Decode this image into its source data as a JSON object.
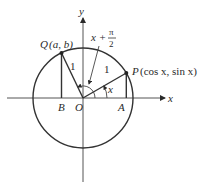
{
  "diagram": {
    "type": "unit-circle",
    "axes": {
      "x_label": "x",
      "y_label": "y"
    },
    "points": {
      "origin": {
        "label": "O"
      },
      "P": {
        "label": "P",
        "coords": "(cos x, sin x)"
      },
      "Q": {
        "label": "Q",
        "coords": "(a, b)"
      },
      "A": {
        "label": "A"
      },
      "B": {
        "label": "B"
      }
    },
    "segments": {
      "OP_length": "1",
      "OQ_length": "1"
    },
    "angles": {
      "angle_x": "x",
      "angle_x_plus": "x +",
      "pi": "π",
      "two": "2"
    }
  }
}
